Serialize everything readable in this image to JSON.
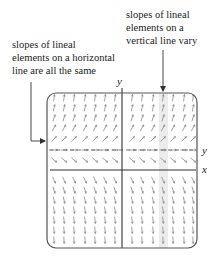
{
  "callouts": {
    "right": {
      "lines": [
        "slopes of lineal",
        "elements on a",
        "vertical line vary"
      ]
    },
    "left": {
      "lines": [
        "slopes of lineal",
        "elements on a horizontal",
        "line are all the same"
      ]
    }
  },
  "axes": {
    "y_axis_label": "y",
    "x_axis_label": "x",
    "equilibrium_line_label": "y"
  },
  "field": {
    "description": "autonomous slope field dy/dx = f(y)",
    "columns_x": [
      54,
      64,
      74,
      85,
      95,
      105,
      115,
      132,
      142,
      153,
      163,
      173,
      184,
      193
    ],
    "rows": [
      {
        "y": 98,
        "angle_deg": -82
      },
      {
        "y": 108,
        "angle_deg": -78
      },
      {
        "y": 118,
        "angle_deg": -72
      },
      {
        "y": 128,
        "angle_deg": -62
      },
      {
        "y": 139,
        "angle_deg": -45
      },
      {
        "y": 150,
        "angle_deg": 0
      },
      {
        "y": 160,
        "angle_deg": 40
      },
      {
        "y": 180,
        "angle_deg": 65
      },
      {
        "y": 190,
        "angle_deg": 72
      },
      {
        "y": 200,
        "angle_deg": 77
      },
      {
        "y": 210,
        "angle_deg": 80
      },
      {
        "y": 220,
        "angle_deg": 83
      },
      {
        "y": 230,
        "angle_deg": 85
      },
      {
        "y": 240,
        "angle_deg": 87
      }
    ],
    "highlight_column_x": 163
  },
  "colors": {
    "frame": "#555555",
    "arrows": "#8a8a8a",
    "axis": "#333333",
    "highlight": "#ececec",
    "text": "#1c1c1c"
  }
}
